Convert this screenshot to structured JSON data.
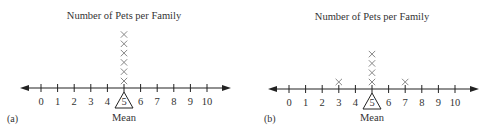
{
  "chart_data": [
    {
      "type": "scatter",
      "subtype": "dot-plot",
      "panel": "(a)",
      "title": "Number of Pets per Family",
      "xlabel": "",
      "ticks": [
        "0",
        "1",
        "2",
        "3",
        "4",
        "5",
        "6",
        "7",
        "8",
        "9",
        "10"
      ],
      "xlim": [
        0,
        10
      ],
      "points": [
        {
          "x": 5,
          "count": 6
        }
      ],
      "mean": 5,
      "mean_label": "Mean",
      "marker": "X",
      "grid": false
    },
    {
      "type": "scatter",
      "subtype": "dot-plot",
      "panel": "(b)",
      "title": "Number of Pets per Family",
      "xlabel": "",
      "ticks": [
        "0",
        "1",
        "2",
        "3",
        "4",
        "5",
        "6",
        "7",
        "8",
        "9",
        "10"
      ],
      "xlim": [
        0,
        10
      ],
      "points": [
        {
          "x": 3,
          "count": 1
        },
        {
          "x": 5,
          "count": 4
        },
        {
          "x": 7,
          "count": 1
        }
      ],
      "mean": 5,
      "mean_label": "Mean",
      "marker": "X",
      "grid": false
    }
  ],
  "colors": {
    "axis": "#222222",
    "marker": "#888888",
    "text": "#333333"
  }
}
